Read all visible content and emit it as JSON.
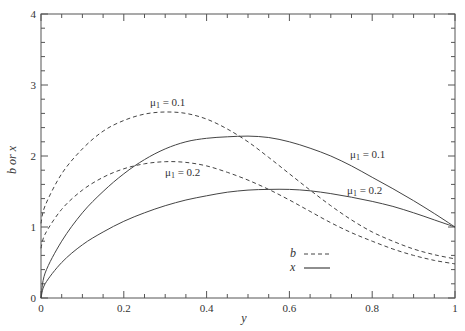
{
  "chart_data": {
    "type": "line",
    "title": "",
    "xlabel": "y",
    "ylabel": "b or x",
    "xlim": [
      0,
      1
    ],
    "ylim": [
      0,
      4
    ],
    "grid": false,
    "xticks": [
      0,
      0.2,
      0.4,
      0.6,
      0.8,
      1
    ],
    "xtick_labels": [
      "0",
      "0.2",
      "0.4",
      "0.6",
      "0.8",
      "1"
    ],
    "yticks": [
      0,
      1,
      2,
      3,
      4
    ],
    "ytick_labels": [
      "0",
      "1",
      "2",
      "3",
      "4"
    ],
    "x": [
      0,
      0.01,
      0.05,
      0.1,
      0.15,
      0.2,
      0.25,
      0.3,
      0.35,
      0.4,
      0.45,
      0.5,
      0.55,
      0.6,
      0.65,
      0.7,
      0.75,
      0.8,
      0.85,
      0.9,
      0.95,
      1.0
    ],
    "series": [
      {
        "name": "b, μ1 = 0.1",
        "style": "dashed",
        "values": [
          1.05,
          1.3,
          1.75,
          2.1,
          2.35,
          2.5,
          2.59,
          2.62,
          2.6,
          2.52,
          2.38,
          2.2,
          1.98,
          1.75,
          1.52,
          1.3,
          1.1,
          0.93,
          0.8,
          0.69,
          0.61,
          0.55
        ]
      },
      {
        "name": "b, μ1 = 0.2",
        "style": "dashed",
        "values": [
          0.7,
          0.9,
          1.25,
          1.52,
          1.7,
          1.82,
          1.89,
          1.92,
          1.91,
          1.86,
          1.77,
          1.66,
          1.53,
          1.38,
          1.22,
          1.06,
          0.92,
          0.8,
          0.69,
          0.6,
          0.53,
          0.48
        ]
      },
      {
        "name": "x, μ1 = 0.1",
        "style": "solid",
        "values": [
          0.0,
          0.35,
          0.8,
          1.2,
          1.5,
          1.75,
          1.95,
          2.1,
          2.2,
          2.25,
          2.27,
          2.28,
          2.26,
          2.2,
          2.11,
          2.0,
          1.86,
          1.7,
          1.54,
          1.37,
          1.19,
          1.0
        ]
      },
      {
        "name": "x, μ1 = 0.2",
        "style": "solid",
        "values": [
          0.0,
          0.2,
          0.5,
          0.75,
          0.93,
          1.08,
          1.2,
          1.3,
          1.38,
          1.44,
          1.49,
          1.52,
          1.53,
          1.53,
          1.51,
          1.47,
          1.42,
          1.36,
          1.29,
          1.2,
          1.1,
          1.0
        ]
      }
    ],
    "annotations": [
      {
        "text": "μ1 = 0.1",
        "near": "b, μ1 = 0.1 peak",
        "x": 0.3,
        "y": 2.7
      },
      {
        "text": "μ1 = 0.2",
        "near": "b, μ1 = 0.2",
        "x": 0.3,
        "y": 1.58
      },
      {
        "text": "μ1 = 0.1",
        "near": "x, μ1 = 0.1",
        "x": 0.75,
        "y": 2.05
      },
      {
        "text": "μ1 = 0.2",
        "near": "x, μ1 = 0.2",
        "x": 0.75,
        "y": 1.5
      }
    ],
    "legend": {
      "position": "lower center-right",
      "entries": [
        {
          "label": "b",
          "style": "dashed"
        },
        {
          "label": "x",
          "style": "solid"
        }
      ]
    }
  },
  "labels": {
    "xlabel": "y",
    "ylabel": "b or x",
    "ann_b01": "μ",
    "ann_b01_sub": "1",
    "ann_b01_val": " = 0.1",
    "ann_b02": "μ",
    "ann_b02_sub": "1",
    "ann_b02_val": " = 0.2",
    "ann_x01": "μ",
    "ann_x01_sub": "1",
    "ann_x01_val": " = 0.1",
    "ann_x02": "μ",
    "ann_x02_sub": "1",
    "ann_x02_val": " = 0.2",
    "legend_b": "b",
    "legend_x": "x"
  },
  "colors": {
    "axis": "#555555",
    "line": "#444444",
    "text": "#333333"
  }
}
